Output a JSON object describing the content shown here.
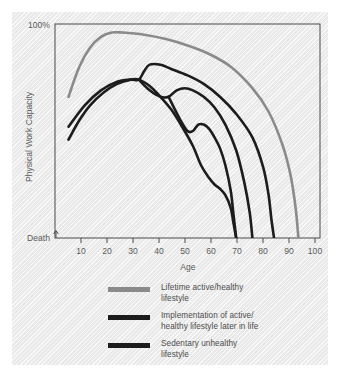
{
  "chart_data": {
    "type": "line",
    "title": "",
    "xlabel": "Age",
    "ylabel": "Physical Work Capacity",
    "xlim": [
      5,
      103
    ],
    "ylim": [
      0,
      100
    ],
    "xticks": [
      10,
      20,
      30,
      40,
      50,
      60,
      70,
      80,
      90,
      100
    ],
    "xticklabels": [
      "10",
      "20",
      "30",
      "40",
      "50",
      "60",
      "70",
      "80",
      "90",
      "100"
    ],
    "ytick_top_label": "100%",
    "ytick_bottom_label": "Death",
    "grid": false,
    "legend_position": "below",
    "series": [
      {
        "name": "Lifetime active/healthy lifestyle",
        "color": "#8a8a8a",
        "x": [
          10,
          14,
          18,
          22,
          26,
          30,
          38,
          46,
          54,
          62,
          70,
          78,
          84,
          89,
          92,
          94,
          95
        ],
        "y": [
          66,
          80,
          89,
          94,
          96,
          96,
          95,
          93,
          90,
          86,
          80,
          70,
          59,
          44,
          30,
          14,
          0
        ]
      },
      {
        "name": "Implementation of active/healthy lifestyle later in life (early intervention)",
        "color": "#1c1c1c",
        "x": [
          10,
          16,
          22,
          28,
          33,
          36,
          38,
          40,
          44,
          48,
          54,
          60,
          66,
          72,
          78,
          82,
          84,
          85,
          86
        ],
        "y": [
          52,
          62,
          69,
          73,
          74,
          74,
          78,
          81,
          81,
          79,
          76,
          72,
          66,
          58,
          47,
          33,
          20,
          9,
          0
        ]
      },
      {
        "name": "Implementation of active/healthy lifestyle later in life (mid intervention)",
        "color": "#1c1c1c",
        "x": [
          36,
          40,
          44,
          47,
          50,
          53,
          56,
          60,
          64,
          68,
          72,
          75,
          77,
          78
        ],
        "y": [
          74,
          69,
          66,
          66,
          69,
          70,
          69,
          66,
          61,
          53,
          41,
          26,
          12,
          0
        ]
      },
      {
        "name": "Implementation of active/healthy lifestyle later in life (late intervention)",
        "color": "#1c1c1c",
        "x": [
          47,
          51,
          54,
          56,
          58,
          60,
          62,
          64,
          66,
          68,
          70,
          71,
          72
        ],
        "y": [
          66,
          56,
          50,
          50,
          53,
          53,
          51,
          47,
          42,
          34,
          22,
          11,
          0
        ]
      },
      {
        "name": "Sedentary unhealthy lifestyle",
        "color": "#1c1c1c",
        "x": [
          10,
          14,
          18,
          23,
          28,
          33,
          36,
          40,
          44,
          48,
          52,
          56,
          59,
          62,
          64,
          66,
          68,
          70,
          71,
          72
        ],
        "y": [
          46,
          55,
          62,
          68,
          72,
          74,
          74,
          71,
          66,
          60,
          52,
          43,
          34,
          28,
          25,
          23,
          20,
          14,
          7,
          0
        ]
      }
    ]
  },
  "axes": {
    "y_top_label": "100%",
    "y_bottom_label": "Death",
    "y_title": "Physical Work Capacity",
    "x_title": "Age",
    "x_tick_labels": [
      "10",
      "20",
      "30",
      "40",
      "50",
      "60",
      "70",
      "80",
      "90",
      "100"
    ]
  },
  "legend": {
    "items": [
      {
        "color": "#8a8a8a",
        "line1": "Lifetime active/healthy",
        "line2": "lifestyle"
      },
      {
        "color": "#1c1c1c",
        "line1": "Implementation of active/",
        "line2": "healthy lifestyle later in life"
      },
      {
        "color": "#1c1c1c",
        "line1": "Sedentary unhealthy",
        "line2": "lifestyle"
      }
    ]
  },
  "colors": {
    "panel_background": "#efefef",
    "frame": "#4a4a4a",
    "gray_curve": "#8a8a8a",
    "black_curve": "#1c1c1c",
    "text": "#5a5a5a"
  }
}
